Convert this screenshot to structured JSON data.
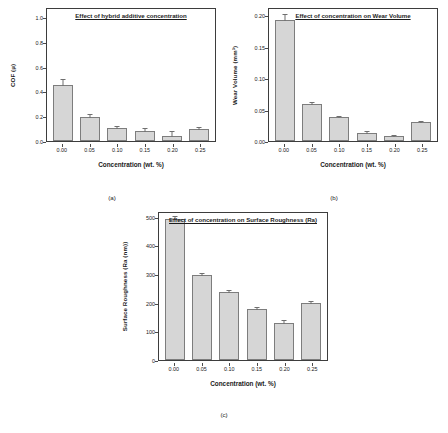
{
  "figure": {
    "background": "#ffffff",
    "bar_fill": "#d6d6d6",
    "bar_stroke": "#7d7d7d",
    "axis_color": "#3d3d3d"
  },
  "panels": [
    {
      "caption": "(a)",
      "chart_data": {
        "type": "bar",
        "title": "Effect of hybrid additive concentration",
        "xlabel": "Concentration (wt. %)",
        "ylabel": "COF (µ)",
        "categories": [
          "0.00",
          "0.05",
          "0.10",
          "0.15",
          "0.20",
          "0.25"
        ],
        "values": [
          0.46,
          0.2,
          0.105,
          0.085,
          0.045,
          0.095
        ],
        "errors": [
          0.022,
          0.01,
          0.009,
          0.012,
          0.017,
          0.011
        ],
        "yticks": [
          "0.0",
          "0.2",
          "0.4",
          "0.6",
          "0.8",
          "1.0"
        ],
        "ytickvalues": [
          0.0,
          0.2,
          0.4,
          0.6,
          0.8,
          1.0
        ],
        "ylim": [
          0.0,
          1.08
        ],
        "grid": false,
        "legend": "none"
      }
    },
    {
      "caption": "(b)",
      "chart_data": {
        "type": "bar",
        "title": "Effect of concentration on Wear Volume",
        "xlabel": "Concentration (wt. %)",
        "ylabel": "Wear Volume (mm³)",
        "categories": [
          "0.00",
          "0.05",
          "0.10",
          "0.15",
          "0.20",
          "0.25"
        ],
        "values": [
          0.196,
          0.06,
          0.038,
          0.0125,
          0.008,
          0.03
        ],
        "errors": [
          0.004,
          0.0015,
          0.0012,
          0.0018,
          0.0012,
          0.0012
        ],
        "yticks": [
          "0.00",
          "0.05",
          "0.10",
          "0.15",
          "0.20"
        ],
        "ytickvalues": [
          0.0,
          0.05,
          0.1,
          0.15,
          0.2
        ],
        "ylim": [
          0.0,
          0.213
        ],
        "grid": false,
        "legend": "none"
      }
    },
    {
      "caption": "(c)",
      "chart_data": {
        "type": "bar",
        "title": "Effect of concentration on Surface Roughness (Ra)",
        "xlabel": "Concentration (wt. %)",
        "ylabel": "Surface Roughness (Ra (nm))",
        "categories": [
          "0.00",
          "0.05",
          "0.10",
          "0.15",
          "0.20",
          "0.25"
        ],
        "values": [
          500,
          300,
          240,
          180,
          132,
          202
        ],
        "errors": [
          6,
          5,
          5,
          5,
          5,
          5
        ],
        "yticks": [
          "0",
          "100",
          "200",
          "300",
          "400",
          "500"
        ],
        "ytickvalues": [
          0,
          100,
          200,
          300,
          400,
          500
        ],
        "ylim": [
          0,
          520
        ],
        "grid": false,
        "legend": "none"
      }
    }
  ]
}
